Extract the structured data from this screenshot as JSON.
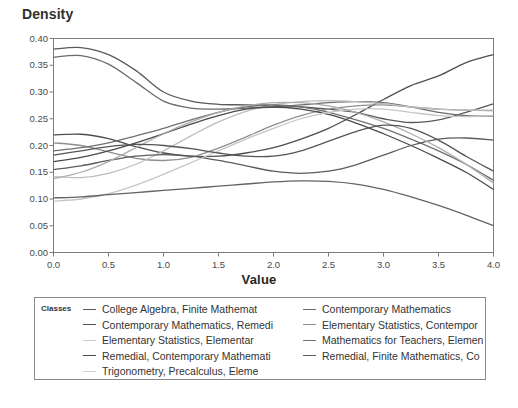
{
  "chart": {
    "ylabel": "Density",
    "xlabel": "Value",
    "legend_title": "Classes"
  },
  "chart_data": {
    "type": "line",
    "title": "",
    "xlabel": "Value",
    "ylabel": "Density",
    "xlim": [
      0.0,
      4.0
    ],
    "ylim": [
      0.0,
      0.4
    ],
    "grid": false,
    "legend_position": "bottom",
    "legend_title": "Classes",
    "xticks": [
      "0.0",
      "0.5",
      "1.0",
      "1.5",
      "2.0",
      "2.5",
      "3.0",
      "3.5",
      "4.0"
    ],
    "yticks": [
      "0.00",
      "0.05",
      "0.10",
      "0.15",
      "0.20",
      "0.25",
      "0.30",
      "0.35",
      "0.40"
    ],
    "x": [
      0.0,
      0.25,
      0.5,
      0.75,
      1.0,
      1.25,
      1.5,
      1.75,
      2.0,
      2.25,
      2.5,
      2.75,
      3.0,
      3.25,
      3.5,
      3.75,
      4.0
    ],
    "series": [
      {
        "name": "College Algebra, Finite Mathemat",
        "color": "#595959",
        "values": [
          0.38,
          0.383,
          0.37,
          0.34,
          0.3,
          0.283,
          0.277,
          0.276,
          0.275,
          0.272,
          0.268,
          0.262,
          0.25,
          0.243,
          0.248,
          0.262,
          0.278
        ]
      },
      {
        "name": "Contemporary Mathematics",
        "color": "#6b6b6b",
        "values": [
          0.365,
          0.368,
          0.352,
          0.318,
          0.283,
          0.27,
          0.268,
          0.27,
          0.272,
          0.276,
          0.28,
          0.282,
          0.28,
          0.272,
          0.262,
          0.256,
          0.255
        ]
      },
      {
        "name": "Contemporary Mathematics, Remedi",
        "color": "#4f4f4f",
        "values": [
          0.22,
          0.221,
          0.213,
          0.198,
          0.186,
          0.18,
          0.18,
          0.186,
          0.196,
          0.212,
          0.232,
          0.258,
          0.286,
          0.312,
          0.33,
          0.355,
          0.37
        ]
      },
      {
        "name": "Elementary Statistics, Contempor",
        "color": "#8f8f8f",
        "values": [
          0.205,
          0.2,
          0.188,
          0.176,
          0.172,
          0.178,
          0.195,
          0.216,
          0.238,
          0.256,
          0.268,
          0.274,
          0.276,
          0.272,
          0.268,
          0.266,
          0.265
        ]
      },
      {
        "name": "Elementary Statistics, Elementar",
        "color": "#bdbdbd",
        "values": [
          0.142,
          0.14,
          0.148,
          0.165,
          0.19,
          0.218,
          0.244,
          0.264,
          0.276,
          0.282,
          0.284,
          0.282,
          0.278,
          0.272,
          0.268,
          0.266,
          0.266
        ]
      },
      {
        "name": "Mathematics for Teachers, Elemen",
        "color": "#707070",
        "values": [
          0.19,
          0.196,
          0.205,
          0.218,
          0.232,
          0.248,
          0.262,
          0.272,
          0.276,
          0.272,
          0.262,
          0.248,
          0.232,
          0.212,
          0.19,
          0.165,
          0.135
        ]
      },
      {
        "name": "Remedial, Contemporary Mathemati",
        "color": "#4a4a4a",
        "values": [
          0.17,
          0.178,
          0.19,
          0.205,
          0.222,
          0.24,
          0.256,
          0.268,
          0.272,
          0.268,
          0.258,
          0.242,
          0.222,
          0.2,
          0.176,
          0.15,
          0.118
        ]
      },
      {
        "name": "Remedial, Finite Mathematics, Co",
        "color": "#5c5c5c",
        "values": [
          0.155,
          0.162,
          0.172,
          0.18,
          0.183,
          0.18,
          0.172,
          0.162,
          0.152,
          0.148,
          0.152,
          0.164,
          0.182,
          0.2,
          0.212,
          0.214,
          0.21
        ]
      },
      {
        "name": "Trigonometry, Precalculus, Eleme",
        "color": "#c6c6c6",
        "values": [
          0.096,
          0.1,
          0.11,
          0.126,
          0.146,
          0.168,
          0.19,
          0.212,
          0.232,
          0.25,
          0.262,
          0.268,
          0.268,
          0.262,
          0.256,
          0.254,
          0.256
        ]
      },
      {
        "name": "extra-series-low",
        "color": "#636363",
        "values": [
          0.102,
          0.104,
          0.108,
          0.112,
          0.116,
          0.12,
          0.124,
          0.128,
          0.132,
          0.134,
          0.133,
          0.128,
          0.118,
          0.104,
          0.088,
          0.07,
          0.05
        ]
      },
      {
        "name": "extra-series-mid",
        "color": "#adadad",
        "values": [
          0.138,
          0.15,
          0.17,
          0.196,
          0.222,
          0.244,
          0.262,
          0.274,
          0.28,
          0.28,
          0.274,
          0.262,
          0.244,
          0.222,
          0.196,
          0.165,
          0.13
        ]
      },
      {
        "name": "extra-series-descending",
        "color": "#555555",
        "values": [
          0.182,
          0.19,
          0.198,
          0.202,
          0.2,
          0.194,
          0.186,
          0.18,
          0.18,
          0.19,
          0.208,
          0.226,
          0.238,
          0.232,
          0.21,
          0.18,
          0.152
        ]
      }
    ]
  },
  "legend": {
    "left_column": [
      {
        "label": "College Algebra, Finite Mathemat",
        "color": "#595959",
        "show_dash": true
      },
      {
        "label": "Contemporary Mathematics, Remedi",
        "color": "#4f4f4f",
        "show_dash": true
      },
      {
        "label": "Elementary Statistics, Elementar",
        "color": "#c9c9c9",
        "show_dash": true
      },
      {
        "label": "Remedial, Contemporary Mathemati",
        "color": "#4a4a4a",
        "show_dash": true
      },
      {
        "label": "Trigonometry, Precalculus, Eleme",
        "color": "#d0d0d0",
        "show_dash": true
      }
    ],
    "right_column": [
      {
        "label": "Contemporary Mathematics",
        "color": "#6b6b6b",
        "show_dash": true
      },
      {
        "label": "Elementary Statistics, Contempor",
        "color": "#8f8f8f",
        "show_dash": true
      },
      {
        "label": "Mathematics for Teachers, Elemen",
        "color": "#707070",
        "show_dash": true
      },
      {
        "label": "Remedial, Finite Mathematics, Co",
        "color": "#5c5c5c",
        "show_dash": true
      }
    ]
  }
}
